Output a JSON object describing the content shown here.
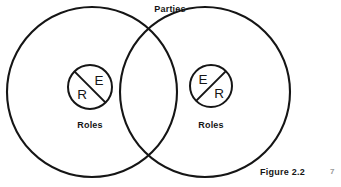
{
  "figure": {
    "title_label": "Parties",
    "caption": "Figure 2.2",
    "page_mark": "7",
    "background_color": "#ffffff",
    "stroke_color": "#151515"
  },
  "diagram": {
    "type": "venn",
    "set_label": "Parties",
    "sets": [
      {
        "id": "left-party",
        "role_label": "Roles",
        "role_tokens": {
          "upper": "E",
          "lower": "R"
        },
        "slash_direction": "top-left-to-bottom-right"
      },
      {
        "id": "right-party",
        "role_label": "Roles",
        "role_tokens": {
          "upper": "E",
          "lower": "R"
        },
        "slash_direction": "bottom-left-to-top-right"
      }
    ]
  },
  "labels": {
    "parties": "Parties",
    "left_roles": "Roles",
    "right_roles": "Roles",
    "left_token_e": "E",
    "left_token_r": "R",
    "right_token_e": "E",
    "right_token_r": "R",
    "figure_caption": "Figure 2.2",
    "page_number": "7"
  }
}
